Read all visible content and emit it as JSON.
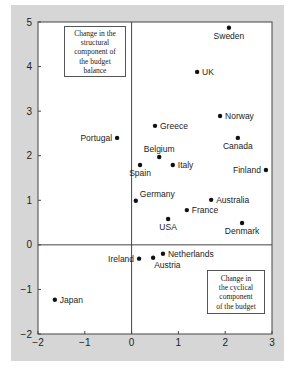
{
  "chart_data": {
    "type": "scatter",
    "title": "",
    "xlabel": "Change in the cyclical component of the budget",
    "ylabel": "Change in the structural component of the budget balance",
    "xlim": [
      -2,
      3
    ],
    "ylim": [
      -2,
      5
    ],
    "xticks": [
      -2,
      -1,
      0,
      1,
      2,
      3
    ],
    "yticks": [
      -2,
      -1,
      0,
      1,
      2,
      3,
      4,
      5
    ],
    "grid": false,
    "legend": null,
    "annotations": [
      {
        "text": "Change in the structural component of the budget balance",
        "position": "top-left"
      },
      {
        "text": "Change in the cyclical component of the budget",
        "position": "bottom-right"
      }
    ],
    "points": [
      {
        "label": "Sweden",
        "x": 2.08,
        "y": 4.87,
        "anchor": "below"
      },
      {
        "label": "UK",
        "x": 1.4,
        "y": 3.88,
        "anchor": "right"
      },
      {
        "label": "Norway",
        "x": 1.89,
        "y": 2.89,
        "anchor": "right"
      },
      {
        "label": "Greece",
        "x": 0.5,
        "y": 2.67,
        "anchor": "right"
      },
      {
        "label": "Portugal",
        "x": -0.31,
        "y": 2.4,
        "anchor": "left"
      },
      {
        "label": "Canada",
        "x": 2.27,
        "y": 2.4,
        "anchor": "below"
      },
      {
        "label": "Belgium",
        "x": 0.59,
        "y": 1.97,
        "anchor": "above"
      },
      {
        "label": "Spain",
        "x": 0.18,
        "y": 1.79,
        "anchor": "below"
      },
      {
        "label": "Italy",
        "x": 0.88,
        "y": 1.79,
        "anchor": "right"
      },
      {
        "label": "Finland",
        "x": 2.87,
        "y": 1.68,
        "anchor": "left"
      },
      {
        "label": "Germany",
        "x": 0.09,
        "y": 0.99,
        "anchor": "upper-right"
      },
      {
        "label": "Australia",
        "x": 1.7,
        "y": 1.01,
        "anchor": "right"
      },
      {
        "label": "France",
        "x": 1.18,
        "y": 0.78,
        "anchor": "right"
      },
      {
        "label": "USA",
        "x": 0.78,
        "y": 0.58,
        "anchor": "below"
      },
      {
        "label": "Denmark",
        "x": 2.36,
        "y": 0.49,
        "anchor": "below"
      },
      {
        "label": "Ireland",
        "x": 0.16,
        "y": -0.31,
        "anchor": "left"
      },
      {
        "label": "Austria",
        "x": 0.46,
        "y": -0.29,
        "anchor": "lower-right"
      },
      {
        "label": "Netherlands",
        "x": 0.67,
        "y": -0.2,
        "anchor": "right"
      },
      {
        "label": "Japan",
        "x": -1.64,
        "y": -1.23,
        "anchor": "right"
      }
    ]
  },
  "notes": {
    "structural": [
      "Change in the",
      "structural",
      "component of",
      "the budget",
      "balance"
    ],
    "cyclical": [
      "Change in",
      "the cyclical",
      "component",
      "of the budget"
    ]
  },
  "colors": {
    "panel": "#d6d6d6",
    "plot": "#ffffff",
    "axis": "#444444",
    "point": "#111111"
  }
}
